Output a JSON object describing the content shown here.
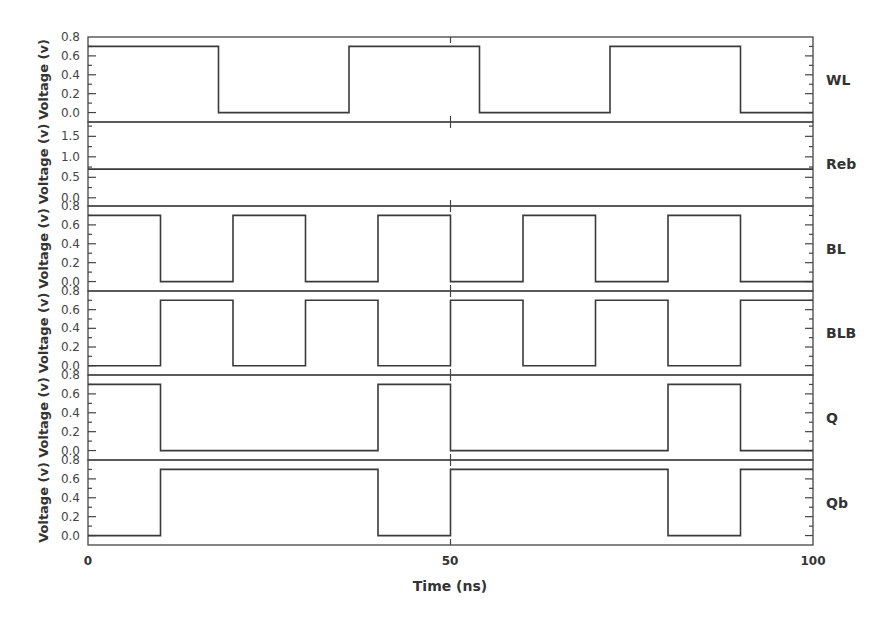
{
  "chart_data": {
    "type": "line",
    "subtype": "stacked-step-waveforms",
    "title": "",
    "xlabel": "Time (ns)",
    "x_ticks": [
      0,
      50,
      100
    ],
    "xlim": [
      0,
      100
    ],
    "grid": false,
    "legend": "none (signal names at right of each panel)",
    "panels": [
      {
        "name": "WL",
        "ylabel": "Voltage (v)",
        "y_ticks": [
          0.0,
          0.2,
          0.4,
          0.6,
          0.8
        ],
        "y_tick_labels": [
          "0.0",
          "0.2",
          "0.4",
          "0.6",
          "0.8"
        ],
        "ylim": [
          -0.1,
          0.8
        ],
        "x": [
          0,
          18,
          18,
          36,
          36,
          54,
          54,
          72,
          72,
          90,
          90,
          100
        ],
        "y": [
          0.7,
          0.7,
          0.0,
          0.0,
          0.7,
          0.7,
          0.0,
          0.0,
          0.7,
          0.7,
          0.0,
          0.0
        ]
      },
      {
        "name": "Reb",
        "ylabel": "Voltage (v)",
        "y_ticks": [
          0.0,
          0.5,
          1.0,
          1.5
        ],
        "y_tick_labels": [
          "0.0",
          "0.5",
          "1.0",
          "1.5"
        ],
        "ylim": [
          -0.2,
          1.85
        ],
        "x": [
          0,
          100
        ],
        "y": [
          0.7,
          0.7
        ]
      },
      {
        "name": "BL",
        "ylabel": "Voltage (v)",
        "y_ticks": [
          0.0,
          0.2,
          0.4,
          0.6,
          0.8
        ],
        "y_tick_labels": [
          "0.0",
          "0.2",
          "0.4",
          "0.6",
          "0.8"
        ],
        "ylim": [
          -0.1,
          0.8
        ],
        "x": [
          0,
          10,
          10,
          20,
          20,
          30,
          30,
          40,
          40,
          50,
          50,
          60,
          60,
          70,
          70,
          80,
          80,
          90,
          90,
          100
        ],
        "y": [
          0.7,
          0.7,
          0.0,
          0.0,
          0.7,
          0.7,
          0.0,
          0.0,
          0.7,
          0.7,
          0.0,
          0.0,
          0.7,
          0.7,
          0.0,
          0.0,
          0.7,
          0.7,
          0.0,
          0.0
        ]
      },
      {
        "name": "BLB",
        "ylabel": "Voltage (v)",
        "y_ticks": [
          0.0,
          0.2,
          0.4,
          0.6,
          0.8
        ],
        "y_tick_labels": [
          "0.0",
          "0.2",
          "0.4",
          "0.6",
          "0.8"
        ],
        "ylim": [
          -0.1,
          0.8
        ],
        "x": [
          0,
          10,
          10,
          20,
          20,
          30,
          30,
          40,
          40,
          50,
          50,
          60,
          60,
          70,
          70,
          80,
          80,
          90,
          90,
          100
        ],
        "y": [
          0.0,
          0.0,
          0.7,
          0.7,
          0.0,
          0.0,
          0.7,
          0.7,
          0.0,
          0.0,
          0.7,
          0.7,
          0.0,
          0.0,
          0.7,
          0.7,
          0.0,
          0.0,
          0.7,
          0.7
        ]
      },
      {
        "name": "Q",
        "ylabel": "Voltage (v)",
        "y_ticks": [
          0.0,
          0.2,
          0.4,
          0.6,
          0.8
        ],
        "y_tick_labels": [
          "0.0",
          "0.2",
          "0.4",
          "0.6",
          "0.8"
        ],
        "ylim": [
          -0.1,
          0.8
        ],
        "x": [
          0,
          10,
          10,
          40,
          40,
          50,
          50,
          80,
          80,
          90,
          90,
          100
        ],
        "y": [
          0.7,
          0.7,
          0.0,
          0.0,
          0.7,
          0.7,
          0.0,
          0.0,
          0.7,
          0.7,
          0.0,
          0.0
        ]
      },
      {
        "name": "Qb",
        "ylabel": "Voltage (v)",
        "y_ticks": [
          0.0,
          0.2,
          0.4,
          0.6,
          0.8
        ],
        "y_tick_labels": [
          "0.0",
          "0.2",
          "0.4",
          "0.6",
          "0.8"
        ],
        "ylim": [
          -0.1,
          0.8
        ],
        "x": [
          0,
          10,
          10,
          40,
          40,
          50,
          50,
          80,
          80,
          90,
          90,
          100
        ],
        "y": [
          0.0,
          0.0,
          0.7,
          0.7,
          0.0,
          0.0,
          0.7,
          0.7,
          0.0,
          0.0,
          0.7,
          0.7
        ]
      }
    ]
  },
  "style": {
    "line_color": "#3a3a3a",
    "axis_color": "#444444",
    "text_color": "#333333"
  },
  "labels": {
    "xlabel": "Time (ns)",
    "x_tick_0": "0",
    "x_tick_50": "50",
    "x_tick_100": "100",
    "ylabel": "Voltage (v)",
    "signals": [
      "WL",
      "Reb",
      "BL",
      "BLB",
      "Q",
      "Qb"
    ]
  }
}
